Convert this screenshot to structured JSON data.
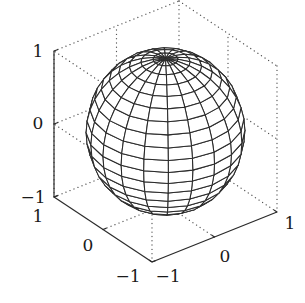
{
  "chart_data": {
    "type": "surface-mesh",
    "title": "",
    "surface": {
      "shape": "sphere",
      "radius": 1,
      "center": [
        0,
        0,
        0
      ],
      "n": 20,
      "edge_color": "#2b2b2b",
      "face_color": "#ffffff"
    },
    "xlabel": "",
    "ylabel": "",
    "zlabel": "",
    "xlim": [
      -1,
      1
    ],
    "ylim": [
      -1,
      1
    ],
    "zlim": [
      -1,
      1
    ],
    "grid": false,
    "box": true,
    "axes": {
      "x": {
        "ticks": [
          -1,
          0,
          1
        ],
        "tick_labels": [
          "−1",
          "0",
          "1"
        ]
      },
      "y": {
        "ticks": [
          -1,
          0,
          1
        ],
        "tick_labels": [
          "−1",
          "0",
          "1"
        ]
      },
      "z": {
        "ticks": [
          -1,
          0,
          1
        ],
        "tick_labels": [
          "−1",
          "0",
          "1"
        ]
      }
    }
  },
  "labels": {
    "z_top": "1",
    "z_mid": "0",
    "z_bottom": "−1",
    "y_top": "1",
    "y_mid": "0",
    "y_bottom": "−1",
    "x_left": "−1",
    "x_mid": "0",
    "x_right": "1"
  },
  "colors": {
    "axis": "#2b2b2b",
    "dotted_box": "#555555",
    "mesh": "#2b2b2b"
  }
}
